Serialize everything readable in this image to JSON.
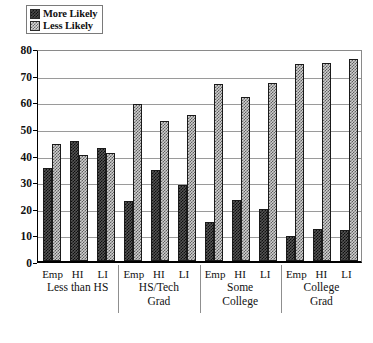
{
  "chart_data": {
    "type": "bar",
    "title": "",
    "xlabel": "",
    "ylabel": "",
    "ylim": [
      0,
      80
    ],
    "ytick_step": 10,
    "yticks": [
      80,
      70,
      60,
      50,
      40,
      30,
      20,
      10,
      0
    ],
    "grid": true,
    "legend_position": "top-left",
    "categories": [
      "Less than HS - Emp",
      "Less than HS - HI",
      "Less than HS - LI",
      "HS/Tech Grad - Emp",
      "HS/Tech Grad - HI",
      "HS/Tech Grad - LI",
      "Some College - Emp",
      "Some College - HI",
      "Some College - LI",
      "College Grad - Emp",
      "College Grad - HI",
      "College Grad - LI"
    ],
    "series": [
      {
        "name": "More Likely",
        "values": [
          35,
          45,
          42.5,
          22.5,
          34,
          28.5,
          14.5,
          23,
          19.5,
          9.5,
          12,
          11.5
        ]
      },
      {
        "name": "Less Likely",
        "values": [
          44,
          40,
          40.5,
          59,
          52.5,
          55,
          66.5,
          61.5,
          67,
          74,
          74.5,
          76
        ]
      }
    ],
    "groups": [
      {
        "name": "Less than HS",
        "name_lines": [
          "Less than HS"
        ],
        "subcategories": [
          "Emp",
          "HI",
          "LI"
        ],
        "more_likely": [
          35,
          45,
          42.5
        ],
        "less_likely": [
          44,
          40,
          40.5
        ]
      },
      {
        "name": "HS/Tech Grad",
        "name_lines": [
          "HS/Tech",
          "Grad"
        ],
        "subcategories": [
          "Emp",
          "HI",
          "LI"
        ],
        "more_likely": [
          22.5,
          34,
          28.5
        ],
        "less_likely": [
          59,
          52.5,
          55
        ]
      },
      {
        "name": "Some College",
        "name_lines": [
          "Some",
          "College"
        ],
        "subcategories": [
          "Emp",
          "HI",
          "LI"
        ],
        "more_likely": [
          14.5,
          23,
          19.5
        ],
        "less_likely": [
          66.5,
          61.5,
          67
        ]
      },
      {
        "name": "College Grad",
        "name_lines": [
          "College",
          "Grad"
        ],
        "subcategories": [
          "Emp",
          "HI",
          "LI"
        ],
        "more_likely": [
          9.5,
          12,
          11.5
        ],
        "less_likely": [
          74,
          74.5,
          76
        ]
      }
    ]
  },
  "legend": {
    "items": [
      {
        "label": "More Likely",
        "swatch": "dark-checkered-swatch",
        "color": "#4a4a4a"
      },
      {
        "label": "Less Likely",
        "swatch": "light-checkered-swatch",
        "color": "#d8d8d8"
      }
    ]
  }
}
